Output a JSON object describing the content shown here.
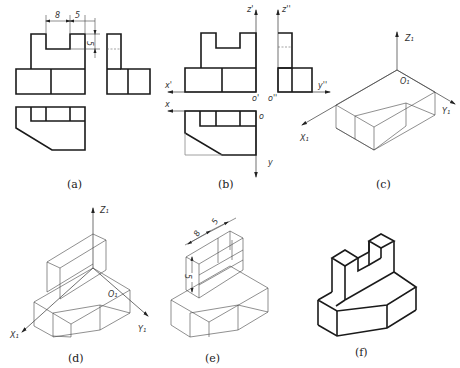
{
  "figure": {
    "panels": [
      {
        "id": "a",
        "caption": "(a)",
        "description": "Three-view orthographic projection"
      },
      {
        "id": "b",
        "caption": "(b)",
        "description": "Three views with projection axes"
      },
      {
        "id": "c",
        "caption": "(c)",
        "description": "Isometric base prism"
      },
      {
        "id": "d",
        "caption": "(d)",
        "description": "Isometric with upright block added"
      },
      {
        "id": "e",
        "caption": "(e)",
        "description": "Isometric with notch dimensions"
      },
      {
        "id": "f",
        "caption": "(f)",
        "description": "Finished isometric drawing"
      }
    ],
    "dimensions": {
      "notch_width": "8",
      "side_width": "5",
      "notch_depth": "5"
    },
    "axis_labels": {
      "z_front": "z'",
      "z_side": "z''",
      "x_front": "x'",
      "x_top": "x",
      "y_side": "y''",
      "y_top": "y",
      "o_front": "o'",
      "o_side": "o''",
      "o_top": "o",
      "iso_z": "Z₁",
      "iso_x": "X₁",
      "iso_y": "Y₁",
      "iso_o": "O₁"
    }
  }
}
